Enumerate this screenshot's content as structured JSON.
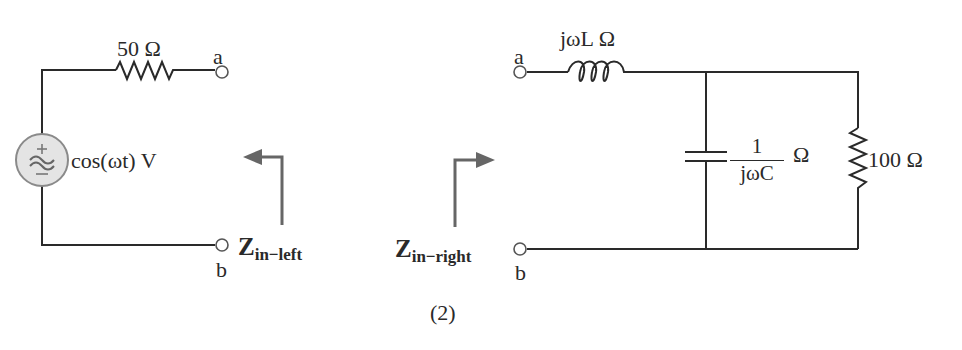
{
  "figure": {
    "caption": "(2)",
    "left_circuit": {
      "resistor_label": "50 Ω",
      "source_label": "cos(ωt) V",
      "source_plus": "+",
      "source_minus": "−",
      "source_symbol": "≈",
      "terminal_a": "a",
      "terminal_b": "b",
      "zin_main": "Z",
      "zin_sub": "in−left"
    },
    "right_circuit": {
      "inductor_label": "jωL  Ω",
      "capacitor_numerator": "1",
      "capacitor_denominator": "jωC",
      "capacitor_unit": "Ω",
      "resistor_label": "100 Ω",
      "terminal_a": "a",
      "terminal_b": "b",
      "zin_main": "Z",
      "zin_sub": "in−right"
    },
    "colors": {
      "wire": "#2a2a2a",
      "arrow": "#666666",
      "source_fill": "#e4e4e4",
      "source_stroke": "#8a8a8a"
    }
  }
}
